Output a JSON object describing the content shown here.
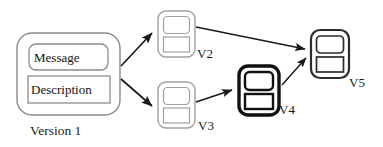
{
  "figure": {
    "kind": "version-history-diagram",
    "background_color": "#ffffff",
    "stroke_color_normal": "#8a8a8a",
    "stroke_color_strong": "#111111",
    "arrow_color": "#1a1a1a",
    "text_color": "#111111"
  },
  "root_node": {
    "label": "Version 1",
    "fields": [
      {
        "name": "message-field",
        "text": "Message",
        "shape": "rounded-rect"
      },
      {
        "name": "description-field",
        "text": "Description",
        "shape": "sharp-rect"
      }
    ]
  },
  "version_nodes": [
    {
      "id": "v2",
      "label": "V2",
      "emphasis": "normal"
    },
    {
      "id": "v3",
      "label": "V3",
      "emphasis": "normal"
    },
    {
      "id": "v4",
      "label": "V4",
      "emphasis": "bold"
    },
    {
      "id": "v5",
      "label": "V5",
      "emphasis": "medium"
    }
  ],
  "edges": [
    {
      "from": "Version 1",
      "to": "V2"
    },
    {
      "from": "Version 1",
      "to": "V3"
    },
    {
      "from": "V2",
      "to": "V5"
    },
    {
      "from": "V3",
      "to": "V4"
    },
    {
      "from": "V4",
      "to": "V5"
    }
  ]
}
